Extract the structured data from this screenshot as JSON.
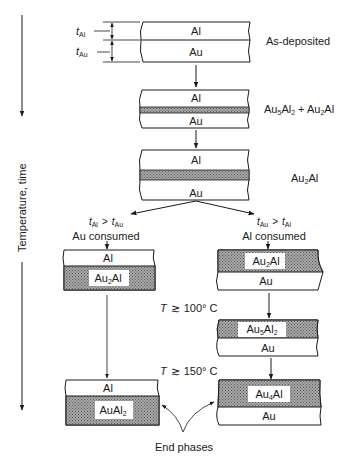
{
  "axis": {
    "label": "Temperature, time"
  },
  "dimensions": {
    "t_al": {
      "main": "t",
      "sub": "Al"
    },
    "t_au": {
      "main": "t",
      "sub": "Au"
    }
  },
  "stages": {
    "as_deposited": {
      "label": "As-deposited",
      "layers": [
        "Al",
        "Au"
      ]
    },
    "stage2": {
      "label_parts": [
        "Au",
        "5",
        "Al",
        "2",
        " + Au",
        "2",
        "Al"
      ],
      "layers": [
        "Al",
        "Au"
      ]
    },
    "stage3": {
      "label_parts": [
        "Au",
        "2",
        "Al"
      ],
      "layers": [
        "Al",
        "Au"
      ]
    }
  },
  "branches": {
    "left": {
      "condition": {
        "a": "t",
        "a_sub": "Al",
        "op": ">",
        "b": "t",
        "b_sub": "Au"
      },
      "caption": "Au consumed",
      "stack1": {
        "top": "Al",
        "bottom_parts": [
          "Au",
          "2",
          "Al"
        ]
      },
      "final": {
        "top": "Al",
        "bottom_parts": [
          "AuAl",
          "2",
          ""
        ]
      }
    },
    "right": {
      "condition": {
        "a": "t",
        "a_sub": "Au",
        "op": ">",
        "b": "t",
        "b_sub": "Al"
      },
      "caption": "Al consumed",
      "stack1": {
        "top_parts": [
          "Au",
          "2",
          "Al"
        ],
        "bottom": "Au"
      },
      "stack2": {
        "top_parts": [
          "Au",
          "5",
          "Al",
          "2"
        ],
        "bottom": "Au"
      },
      "final": {
        "top_parts": [
          "Au",
          "4",
          "Al"
        ],
        "bottom": "Au"
      }
    }
  },
  "temperatures": {
    "t100": {
      "symbol": "T",
      "op": "≳",
      "value": "100° C"
    },
    "t150": {
      "symbol": "T",
      "op": "≳",
      "value": "150° C"
    }
  },
  "end_label": "End phases",
  "colors": {
    "line": "#1a1a1a",
    "hatch_bg": "#9a9a9a",
    "hatch_fg": "#555555",
    "background": "#ffffff"
  }
}
